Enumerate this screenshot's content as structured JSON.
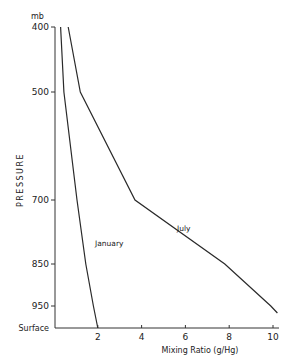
{
  "chart_data": {
    "type": "line",
    "title": "",
    "xlabel": "Mixing Ratio (g/Hg)",
    "ylabel": "PRESSURE",
    "y_unit": "mb",
    "xlim": [
      0,
      10.3
    ],
    "x_ticks": [
      2,
      4,
      6,
      8,
      10
    ],
    "x_tick_labels": [
      "2",
      "4",
      "6",
      "8",
      "10"
    ],
    "y_levels": [
      "400",
      "500",
      "700",
      "850",
      "950",
      "Surface"
    ],
    "y_tick_labels": [
      "400",
      "500",
      "700",
      "850",
      "950",
      "Surface"
    ],
    "grid": false,
    "series": [
      {
        "name": "January",
        "points": [
          {
            "level": "400",
            "x": 0.3
          },
          {
            "level": "500",
            "x": 0.45
          },
          {
            "level": "700",
            "x": 1.05
          },
          {
            "level": "850",
            "x": 1.45
          },
          {
            "level": "950",
            "x": 1.8
          },
          {
            "level": "Surface",
            "x": 2.0
          }
        ]
      },
      {
        "name": "July",
        "points": [
          {
            "level": "400",
            "x": 0.65
          },
          {
            "level": "500",
            "x": 1.2
          },
          {
            "level": "700",
            "x": 3.7
          },
          {
            "level": "850",
            "x": 7.8
          },
          {
            "level": "950",
            "x": 9.9
          },
          {
            "level": "960",
            "x": 10.2
          }
        ]
      }
    ]
  }
}
